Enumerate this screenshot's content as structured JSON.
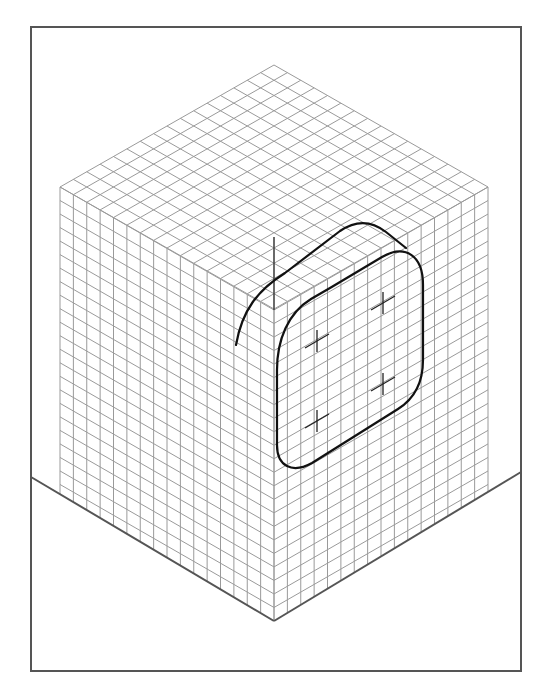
{
  "figure": {
    "colors": {
      "frame": "#555555",
      "grid": "#9a9a9a",
      "ink": "#111111",
      "background": "#ffffff"
    },
    "frame": {
      "x": 31,
      "y": 27,
      "width": 490,
      "height": 644
    },
    "cube": {
      "top_vertex": [
        274,
        65
      ],
      "left_vertex": [
        60,
        187
      ],
      "right_vertex": [
        488,
        187
      ],
      "center_vertex": [
        274,
        310
      ],
      "bottom_vertex": [
        274,
        621
      ],
      "cells_per_edge": 16,
      "vertical_cells": 23
    },
    "ground_lines": {
      "left": [
        [
          31,
          477
        ],
        [
          274,
          621
        ]
      ],
      "right": [
        [
          521,
          472
        ],
        [
          274,
          621
        ]
      ]
    },
    "construction": {
      "center_marks": [
        [
          383,
          303
        ],
        [
          317,
          341
        ],
        [
          383,
          384
        ],
        [
          317,
          421
        ]
      ],
      "vertical_axis": {
        "x": 274,
        "y_top": 237,
        "y_bottom": 310
      }
    }
  }
}
